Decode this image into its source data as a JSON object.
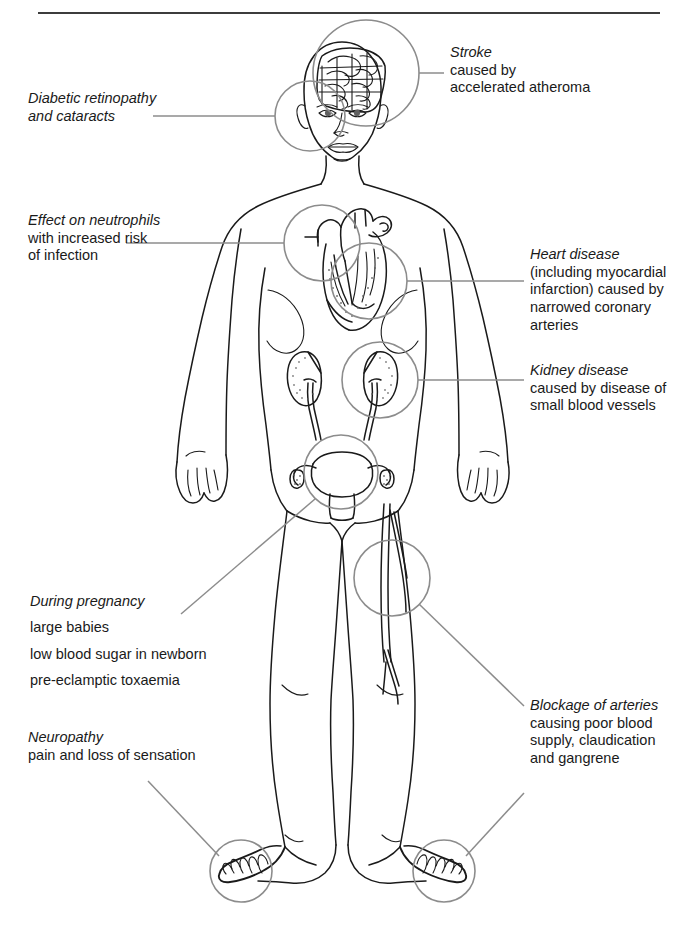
{
  "figure": {
    "alt": "Front view of a female human figure with cut-away views of brain, heart, kidneys, uterus and leg arteries; grey circles highlight affected regions connected by leader lines to labels",
    "colors": {
      "outline": "#1a1a1a",
      "highlight_circle": "#8c8c8c",
      "leader_line": "#8c8c8c",
      "top_rule": "#3c3c3c",
      "text": "#1a1a1a",
      "background": "#ffffff"
    },
    "organs": [
      "brain-cutaway",
      "eye",
      "heart",
      "kidney-left",
      "kidney-right",
      "uterus-ovaries",
      "leg-arteries",
      "foot-toes-left",
      "foot-toes-right"
    ]
  },
  "labels": {
    "stroke": {
      "heading": "Stroke",
      "lines": [
        "caused by",
        "accelerated atheroma"
      ]
    },
    "retinopathy": {
      "heading": "Diabetic retinopathy",
      "lines": [
        "and cataracts"
      ],
      "heading_continues_italic": true
    },
    "neutrophils": {
      "heading": "Effect on neutrophils",
      "lines": [
        "with increased risk",
        "of infection"
      ]
    },
    "heart": {
      "heading": "Heart disease",
      "lines": [
        "(including myocardial",
        "infarction) caused by",
        "narrowed coronary",
        "arteries"
      ]
    },
    "kidney": {
      "heading": "Kidney disease",
      "lines": [
        "caused by disease of",
        "small blood vessels"
      ]
    },
    "pregnancy": {
      "heading": "During pregnancy",
      "lines": [
        "large babies",
        "low blood sugar in newborn",
        "pre-eclamptic toxaemia"
      ]
    },
    "blockage": {
      "heading": "Blockage of arteries",
      "lines": [
        "causing poor blood",
        "supply, claudication",
        "and gangrene"
      ]
    },
    "neuropathy": {
      "heading": "Neuropathy",
      "lines": [
        "pain and loss of sensation"
      ]
    }
  }
}
